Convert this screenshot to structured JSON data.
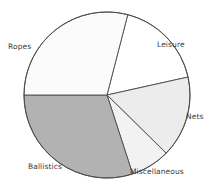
{
  "chart_data": {
    "type": "pie",
    "title": "",
    "subtitle": "",
    "xlabel": "",
    "ylabel": "",
    "legend_position": "none",
    "labels_position": "outside",
    "grid": false,
    "center": {
      "x": 107,
      "y": 95
    },
    "radius": 83,
    "start_angle_deg": 75.5,
    "direction": "clockwise",
    "categories": [
      "Leisure",
      "Nets",
      "Miscellaneous",
      "Ballistics",
      "Ropes"
    ],
    "values": [
      17.5,
      15.8,
      7.6,
      30.0,
      29.1
    ],
    "slices": [
      {
        "label": "Leisure",
        "value": 17.5,
        "angle_deg": 63.0,
        "start_deg": 75.5,
        "end_deg": 12.5,
        "fill": "#ffffff",
        "stroke": "#4a4a4a",
        "label_x": 157,
        "label_y": 40
      },
      {
        "label": "Nets",
        "value": 15.8,
        "angle_deg": 57.0,
        "start_deg": 12.5,
        "end_deg": -44.5,
        "fill": "#ececec",
        "stroke": "#4a4a4a",
        "label_x": 186,
        "label_y": 112
      },
      {
        "label": "Miscellaneous",
        "value": 7.6,
        "angle_deg": 27.5,
        "start_deg": -44.5,
        "end_deg": -72.0,
        "fill": "#f2f2f2",
        "stroke": "#4a4a4a",
        "label_x": 130,
        "label_y": 167
      },
      {
        "label": "Ballistics",
        "value": 30.0,
        "angle_deg": 108.0,
        "start_deg": -72.0,
        "end_deg": -180.0,
        "fill": "#b2b2b2",
        "stroke": "#4a4a4a",
        "label_x": 28,
        "label_y": 162
      },
      {
        "label": "Ropes",
        "value": 29.1,
        "angle_deg": 104.5,
        "start_deg": 180.0,
        "end_deg": 75.5,
        "fill": "#fbfbfb",
        "stroke": "#4a4a4a",
        "label_x": 8,
        "label_y": 42
      }
    ],
    "colors": {
      "background": "#ffffff",
      "outline": "#4a4a4a",
      "label_text": "#3a3a3a",
      "fill_white": "#ffffff",
      "fill_light": "#ececec",
      "fill_lighter": "#f2f2f2",
      "fill_gray": "#b2b2b2"
    }
  }
}
